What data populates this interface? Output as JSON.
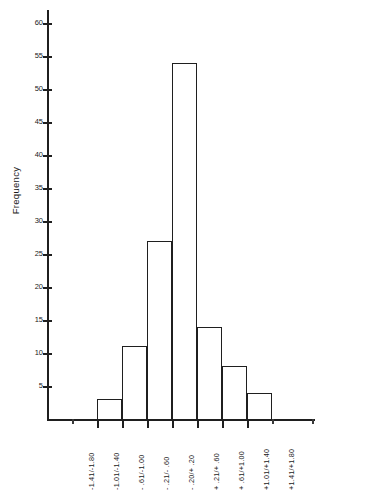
{
  "chart_data": {
    "type": "bar",
    "title": "",
    "subtitle": "",
    "xlabel": "",
    "ylabel": "Frequency",
    "categories": [
      "-1.41/-1.80",
      "-1.01/-1.40",
      "- .61/-1.00",
      "- .21/- .60",
      "- .20/+ .20",
      "+ .21/+ .60",
      "+ .61/+1.00",
      "+1.01/+1.40",
      "+1.41/+1.80"
    ],
    "values": [
      0,
      3,
      11,
      27,
      54,
      14,
      8,
      4,
      0
    ],
    "ylim": [
      0,
      62
    ],
    "xlim": [
      0,
      9
    ],
    "ytick_labels": [
      "5",
      "10",
      "15",
      "20",
      "25",
      "30",
      "35",
      "40",
      "45",
      "50",
      "55",
      "60"
    ],
    "ytick_values": [
      5,
      10,
      15,
      20,
      25,
      30,
      35,
      40,
      45,
      50,
      55,
      60
    ],
    "grid": false,
    "legend": null,
    "legend_position": "none",
    "bar_style": "outline",
    "colors": {
      "axis": "#1f1f1f",
      "bar_outline": "#1f1f1f",
      "bar_fill": "transparent",
      "text": "#1a1a1a",
      "background": "#ffffff"
    }
  }
}
